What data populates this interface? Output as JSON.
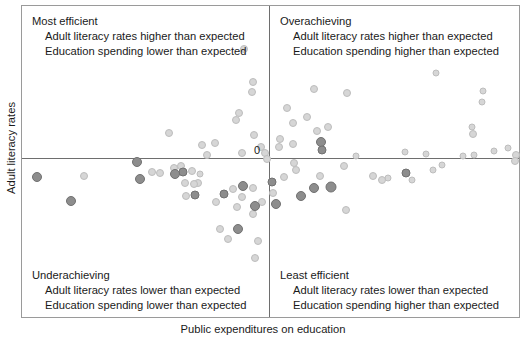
{
  "chart_data": {
    "type": "scatter",
    "title": "",
    "xlabel": "Public expenditures on education",
    "ylabel": "Adult literacy rates",
    "origin_label": "0",
    "grid": false,
    "legend": "none",
    "axis_style": "quadrant cross at origin (0,0)",
    "xlim": [
      -1.0,
      1.0
    ],
    "ylim": [
      -1.0,
      1.0
    ],
    "annotations": [
      {
        "quadrant": "top-left",
        "title": "Most efficient",
        "lines": [
          "Adult literacy rates higher than expected",
          "Education spending lower than expected"
        ]
      },
      {
        "quadrant": "top-right",
        "title": "Overachieving",
        "lines": [
          "Adult literacy rates higher than expected",
          "Education spending higher than expected"
        ]
      },
      {
        "quadrant": "bottom-left",
        "title": "Underachieving",
        "lines": [
          "Adult literacy rates lower than expected",
          "Education spending lower than expected"
        ]
      },
      {
        "quadrant": "bottom-right",
        "title": "Least efficient",
        "lines": [
          "Adult literacy rates lower than expected",
          "Education spending higher than expected"
        ]
      }
    ],
    "series": [
      {
        "name": "countries",
        "marker": "circle",
        "colors": {
          "light": "#d6d6d6",
          "dark": "#8d8d8d"
        },
        "points": [
          {
            "x": 0.666,
            "y": 0.557,
            "shade": "light",
            "size": 7
          },
          {
            "x": 0.857,
            "y": 0.444,
            "shade": "light",
            "size": 7
          },
          {
            "x": 0.853,
            "y": 0.367,
            "shade": "light",
            "size": 7
          },
          {
            "x": 0.813,
            "y": 0.203,
            "shade": "light",
            "size": 7
          },
          {
            "x": 0.817,
            "y": 0.157,
            "shade": "light",
            "size": 8
          },
          {
            "x": 0.544,
            "y": 0.041,
            "shade": "light",
            "size": 7
          },
          {
            "x": 0.9,
            "y": 0.049,
            "shade": "light",
            "size": 7
          },
          {
            "x": 0.954,
            "y": 0.068,
            "shade": "light",
            "size": 7
          },
          {
            "x": 0.986,
            "y": 0.021,
            "shade": "light",
            "size": 8
          },
          {
            "x": 0.982,
            "y": -0.018,
            "shade": "light",
            "size": 8
          },
          {
            "x": 0.774,
            "y": 0.016,
            "shade": "light",
            "size": 7
          },
          {
            "x": 0.82,
            "y": 0.018,
            "shade": "light",
            "size": 7
          },
          {
            "x": 0.69,
            "y": -0.049,
            "shade": "light",
            "size": 7
          },
          {
            "x": 0.628,
            "y": 0.025,
            "shade": "light",
            "size": 7
          },
          {
            "x": 0.655,
            "y": -0.08,
            "shade": "light",
            "size": 7
          },
          {
            "x": 0.548,
            "y": -0.099,
            "shade": "dark",
            "size": 9
          },
          {
            "x": 0.572,
            "y": -0.142,
            "shade": "light",
            "size": 7
          },
          {
            "x": 0.475,
            "y": -0.13,
            "shade": "light",
            "size": 7
          },
          {
            "x": 0.452,
            "y": -0.147,
            "shade": "light",
            "size": 8
          },
          {
            "x": 0.417,
            "y": -0.121,
            "shade": "light",
            "size": 8
          },
          {
            "x": 0.348,
            "y": 0.014,
            "shade": "light",
            "size": 7
          },
          {
            "x": -0.1,
            "y": 0.717,
            "shade": "light",
            "size": 8
          },
          {
            "x": -0.063,
            "y": 0.5,
            "shade": "light",
            "size": 8
          },
          {
            "x": -0.07,
            "y": 0.432,
            "shade": "light",
            "size": 8
          },
          {
            "x": -0.122,
            "y": 0.296,
            "shade": "light",
            "size": 8
          },
          {
            "x": -0.131,
            "y": 0.252,
            "shade": "light",
            "size": 8
          },
          {
            "x": -0.4,
            "y": 0.167,
            "shade": "light",
            "size": 8
          },
          {
            "x": -0.062,
            "y": 0.15,
            "shade": "light",
            "size": 8
          },
          {
            "x": -0.216,
            "y": 0.1,
            "shade": "light",
            "size": 8
          },
          {
            "x": -0.268,
            "y": 0.083,
            "shade": "light",
            "size": 8
          },
          {
            "x": -0.25,
            "y": 0.023,
            "shade": "light",
            "size": 8
          },
          {
            "x": -0.108,
            "y": 0.032,
            "shade": "light",
            "size": 8
          },
          {
            "x": -0.353,
            "y": -0.05,
            "shade": "light",
            "size": 8
          },
          {
            "x": -0.381,
            "y": -0.064,
            "shade": "light",
            "size": 8
          },
          {
            "x": -0.343,
            "y": -0.092,
            "shade": "dark",
            "size": 9
          },
          {
            "x": -0.307,
            "y": -0.083,
            "shade": "light",
            "size": 8
          },
          {
            "x": -0.275,
            "y": -0.104,
            "shade": "light",
            "size": 7
          },
          {
            "x": -0.033,
            "y": 0.075,
            "shade": "light",
            "size": 8
          },
          {
            "x": -0.016,
            "y": 0.03,
            "shade": "light",
            "size": 8
          },
          {
            "x": -0.009,
            "y": -0.009,
            "shade": "light",
            "size": 8
          },
          {
            "x": 0.045,
            "y": 0.122,
            "shade": "light",
            "size": 8
          },
          {
            "x": 0.038,
            "y": 0.07,
            "shade": "light",
            "size": 8
          },
          {
            "x": 0.096,
            "y": 0.093,
            "shade": "light",
            "size": 8
          },
          {
            "x": 0.191,
            "y": 0.18,
            "shade": "light",
            "size": 8
          },
          {
            "x": 0.097,
            "y": 0.233,
            "shade": "light",
            "size": 8
          },
          {
            "x": 0.152,
            "y": 0.272,
            "shade": "light",
            "size": 8
          },
          {
            "x": 0.236,
            "y": 0.205,
            "shade": "light",
            "size": 8
          },
          {
            "x": 0.072,
            "y": 0.332,
            "shade": "light",
            "size": 8
          },
          {
            "x": 0.178,
            "y": 0.455,
            "shade": "light",
            "size": 8
          },
          {
            "x": 0.312,
            "y": 0.425,
            "shade": "light",
            "size": 8
          },
          {
            "x": 0.208,
            "y": 0.106,
            "shade": "dark",
            "size": 10
          },
          {
            "x": 0.213,
            "y": 0.053,
            "shade": "dark",
            "size": 9
          },
          {
            "x": 0.1,
            "y": -0.036,
            "shade": "light",
            "size": 8
          },
          {
            "x": 0.106,
            "y": -0.08,
            "shade": "light",
            "size": 8
          },
          {
            "x": 0.058,
            "y": -0.126,
            "shade": "light",
            "size": 8
          },
          {
            "x": 0.203,
            "y": -0.12,
            "shade": "light",
            "size": 8
          },
          {
            "x": 0.013,
            "y": -0.16,
            "shade": "dark",
            "size": 9
          },
          {
            "x": 0.015,
            "y": -0.232,
            "shade": "light",
            "size": 8
          },
          {
            "x": -0.03,
            "y": -0.29,
            "shade": "light",
            "size": 8
          },
          {
            "x": -0.063,
            "y": -0.366,
            "shade": "light",
            "size": 8
          },
          {
            "x": -0.065,
            "y": -0.199,
            "shade": "light",
            "size": 8
          },
          {
            "x": -0.11,
            "y": -0.256,
            "shade": "light",
            "size": 8
          },
          {
            "x": -0.143,
            "y": -0.205,
            "shade": "light",
            "size": 8
          },
          {
            "x": -0.13,
            "y": -0.322,
            "shade": "light",
            "size": 8
          },
          {
            "x": -0.181,
            "y": -0.237,
            "shade": "dark",
            "size": 9
          },
          {
            "x": -0.213,
            "y": -0.29,
            "shade": "light",
            "size": 8
          },
          {
            "x": -0.286,
            "y": -0.167,
            "shade": "light",
            "size": 8
          },
          {
            "x": -0.301,
            "y": -0.171,
            "shade": "light",
            "size": 8
          },
          {
            "x": -0.338,
            "y": -0.163,
            "shade": "light",
            "size": 8
          },
          {
            "x": -0.297,
            "y": -0.243,
            "shade": "dark",
            "size": 9
          },
          {
            "x": -0.331,
            "y": -0.247,
            "shade": "light",
            "size": 8
          },
          {
            "x": -0.376,
            "y": -0.104,
            "shade": "dark",
            "size": 10
          },
          {
            "x": -0.437,
            "y": -0.1,
            "shade": "light",
            "size": 8
          },
          {
            "x": -0.468,
            "y": -0.09,
            "shade": "light",
            "size": 8
          },
          {
            "x": -0.516,
            "y": -0.139,
            "shade": "dark",
            "size": 10
          },
          {
            "x": -0.527,
            "y": -0.025,
            "shade": "dark",
            "size": 10
          },
          {
            "x": -0.742,
            "y": -0.12,
            "shade": "light",
            "size": 8
          },
          {
            "x": -0.793,
            "y": -0.286,
            "shade": "dark",
            "size": 10
          },
          {
            "x": -0.93,
            "y": -0.126,
            "shade": "dark",
            "size": 10
          },
          {
            "x": 0.126,
            "y": -0.25,
            "shade": "dark",
            "size": 10
          },
          {
            "x": 0.18,
            "y": -0.196,
            "shade": "dark",
            "size": 10
          },
          {
            "x": 0.248,
            "y": -0.192,
            "shade": "dark",
            "size": 11
          },
          {
            "x": 0.027,
            "y": -0.302,
            "shade": "dark",
            "size": 10
          },
          {
            "x": -0.056,
            "y": -0.315,
            "shade": "dark",
            "size": 10
          },
          {
            "x": -0.106,
            "y": -0.185,
            "shade": "dark",
            "size": 10
          },
          {
            "x": -0.126,
            "y": -0.47,
            "shade": "dark",
            "size": 10
          },
          {
            "x": -0.196,
            "y": -0.466,
            "shade": "light",
            "size": 8
          },
          {
            "x": -0.164,
            "y": -0.532,
            "shade": "light",
            "size": 8
          },
          {
            "x": -0.046,
            "y": -0.545,
            "shade": "light",
            "size": 8
          },
          {
            "x": -0.058,
            "y": -0.66,
            "shade": "light",
            "size": 8
          },
          {
            "x": 0.3,
            "y": -0.055,
            "shade": "light",
            "size": 8
          },
          {
            "x": 0.306,
            "y": -0.34,
            "shade": "light",
            "size": 8
          }
        ]
      }
    ]
  }
}
